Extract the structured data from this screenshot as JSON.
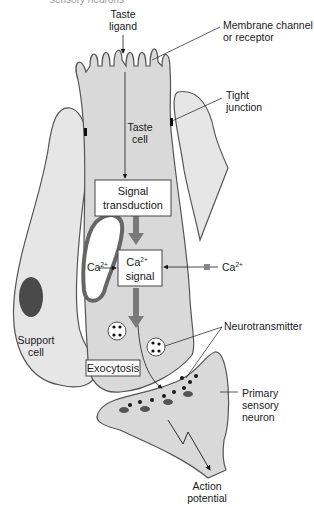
{
  "figure": {
    "top_cut_label": "sensory neurons",
    "labels": {
      "taste_ligand": [
        "Taste",
        "ligand"
      ],
      "membrane_channel": [
        "Membrane channel",
        "or receptor"
      ],
      "tight_junction": [
        "Tight",
        "junction"
      ],
      "taste_cell": [
        "Taste",
        "cell"
      ],
      "signal_transduction": [
        "Signal",
        "transduction"
      ],
      "ca_signal_ion": "Ca",
      "ca_signal_sup": "2+",
      "ca_signal_word": "signal",
      "ca_internal": "Ca",
      "ca_internal_sup": "2+",
      "ca_external": "Ca",
      "ca_external_sup": "2+",
      "support_cell": [
        "Support",
        "cell"
      ],
      "neurotransmitter": "Neurotransmitter",
      "exocytosis": "Exocytosis",
      "primary_sensory_neuron": [
        "Primary",
        "sensory",
        "neuron"
      ],
      "action_potential": [
        "Action",
        "potential"
      ]
    },
    "colors": {
      "cell_fill": "#d9d9d9",
      "support_fill": "#e6e6e6",
      "outline": "#555555",
      "arrow_thick": "#7a7a7a",
      "nucleus": "#4a4a4a",
      "box_fill": "#ffffff"
    }
  }
}
